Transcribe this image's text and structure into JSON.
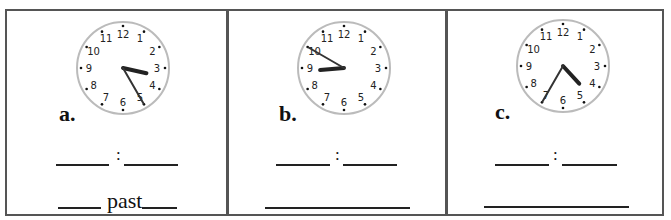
{
  "worksheet": {
    "panels": [
      {
        "label": "a.",
        "time": {
          "hour": 3,
          "minute": 25
        },
        "answer_separator": ":",
        "word_prompt": "past"
      },
      {
        "label": "b.",
        "time": {
          "hour": 8,
          "minute": 50
        },
        "answer_separator": ":",
        "word_prompt": ""
      },
      {
        "label": "c.",
        "time": {
          "hour": 4,
          "minute": 35
        },
        "answer_separator": ":",
        "word_prompt": ""
      }
    ],
    "clock_numbers": [
      "12",
      "1",
      "2",
      "3",
      "4",
      "5",
      "6",
      "7",
      "8",
      "9",
      "10",
      "11"
    ]
  }
}
